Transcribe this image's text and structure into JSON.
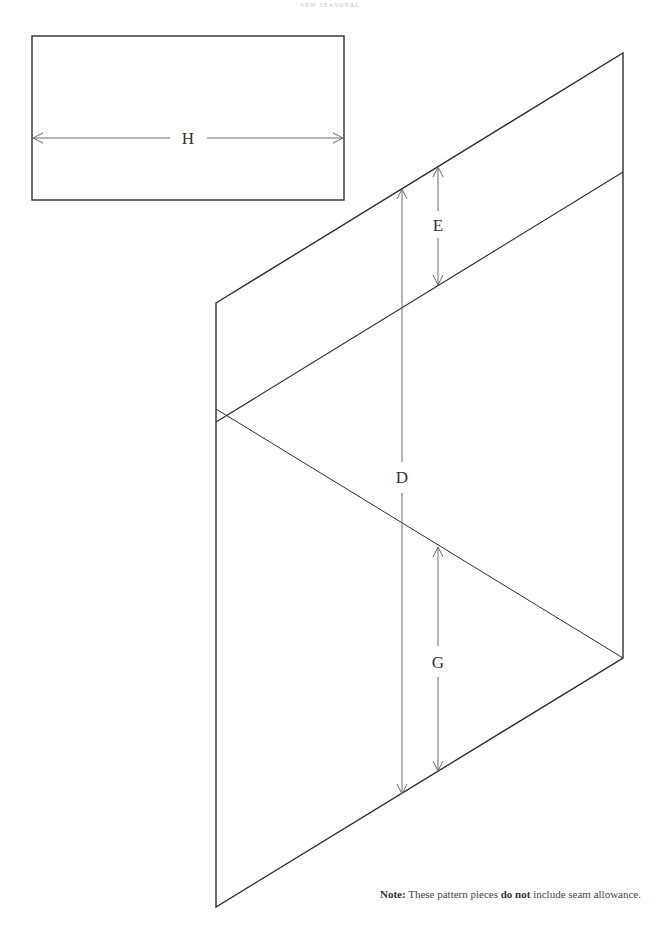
{
  "header": {
    "running_head": "SEW SEASONAL"
  },
  "pieces": {
    "rectangle": {
      "dimension_label": "H"
    },
    "parallelogram": {
      "dimension_labels": {
        "top_band": "E",
        "overall": "D",
        "lower": "G"
      }
    }
  },
  "note": {
    "prefix": "Note:",
    "text_before": " These pattern pieces ",
    "emphasis": "do not",
    "text_after": " include seam allowance."
  },
  "colors": {
    "outline": "#2e2e2e",
    "dimension_line": "#6a6a6a",
    "background": "#ffffff"
  }
}
